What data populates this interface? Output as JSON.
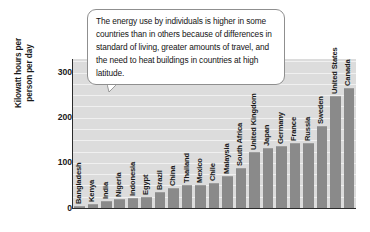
{
  "callout": {
    "text": "The energy use by individuals is higher in some countries than in others because of differences in standard of living, greater amounts of travel, and the need to heat buildings in countries at high latitude."
  },
  "axis": {
    "y_title": "Kilowatt hours per\nperson per day",
    "y_ticks": [
      "0",
      "100",
      "200",
      "300"
    ]
  },
  "chart_data": {
    "type": "bar",
    "title": "",
    "xlabel": "",
    "ylabel": "Kilowatt hours per person per day",
    "ylim": [
      0,
      330
    ],
    "yticks": [
      0,
      100,
      200,
      300
    ],
    "grid": true,
    "legend": "none",
    "orientation": "vertical",
    "bar_color": "#8a8a8a",
    "plot_background": "#dcdcdc",
    "categories": [
      "Bangladesh",
      "Kenya",
      "India",
      "Nigeria",
      "Indonesia",
      "Egypt",
      "Brazil",
      "China",
      "Thailand",
      "Mexico",
      "Chile",
      "Malaysia",
      "South Africa",
      "United Kingdom",
      "Japan",
      "Germany",
      "France",
      "Russia",
      "Sweden",
      "United States",
      "Canada"
    ],
    "values": [
      5,
      8,
      15,
      20,
      22,
      25,
      35,
      45,
      52,
      52,
      55,
      72,
      88,
      125,
      132,
      138,
      145,
      145,
      182,
      248,
      265
    ],
    "annotations": [
      "The energy use by individuals is higher in some countries than in others because of differences in standard of living, greater amounts of travel, and the need to heat buildings in countries at high latitude."
    ]
  }
}
